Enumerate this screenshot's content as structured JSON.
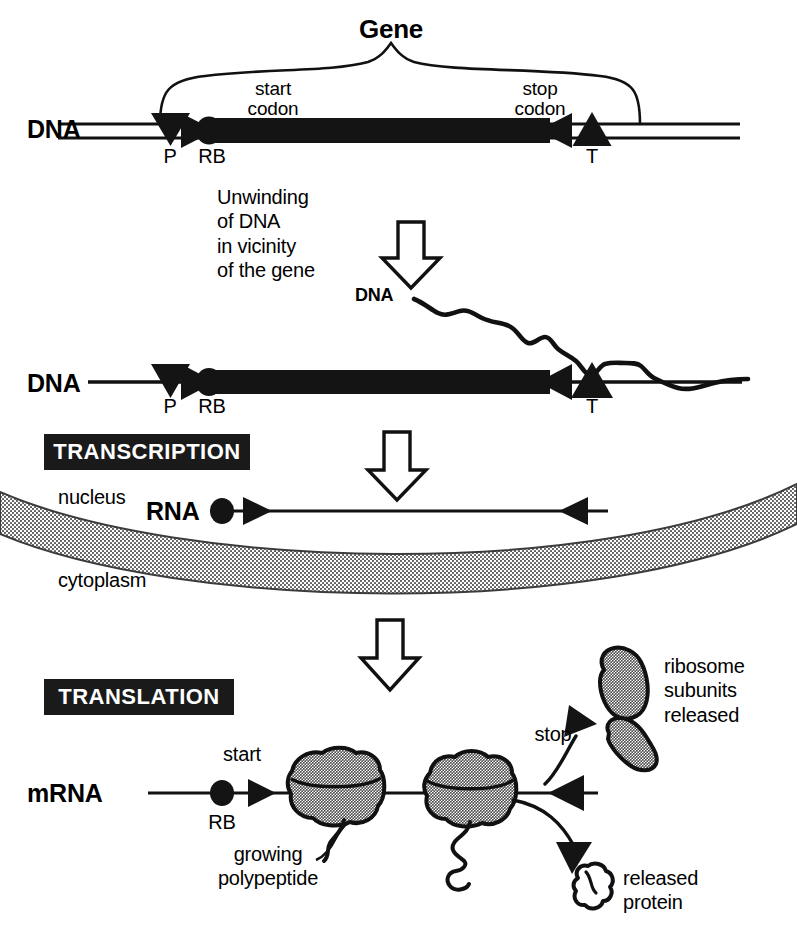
{
  "diagram": {
    "title_label": "Gene",
    "stage1": {
      "dna_label": "DNA",
      "start_codon_label": "start\ncodon",
      "stop_codon_label": "stop\ncodon",
      "promoter_label": "P",
      "ribosome_binding_label": "RB",
      "terminator_label": "T"
    },
    "unwinding": {
      "text": "Unwinding\nof DNA\nin vicinity\nof the gene",
      "dna_strand_label": "DNA"
    },
    "stage2": {
      "dna_label": "DNA",
      "promoter_label": "P",
      "ribosome_binding_label": "RB",
      "terminator_label": "T"
    },
    "transcription": {
      "box_label": "TRANSCRIPTION",
      "rna_label": "RNA",
      "nucleus_label": "nucleus",
      "cytoplasm_label": "cytoplasm"
    },
    "translation": {
      "box_label": "TRANSLATION",
      "mrna_label": "mRNA",
      "start_label": "start",
      "ribosome_binding_label": "RB",
      "growing_polypeptide_label": "growing\npolypeptide",
      "stop_label": "stop",
      "ribosome_subunits_label": "ribosome\nsubunits\nreleased",
      "released_protein_label": "released\nprotein"
    },
    "colors": {
      "ink": "#000000",
      "background": "#ffffff",
      "label_box_fill": "#1a1a1a",
      "label_box_text": "#ffffff",
      "stipple_gray": "#9a9a9a",
      "membrane_gray": "#8f8f8f"
    }
  }
}
